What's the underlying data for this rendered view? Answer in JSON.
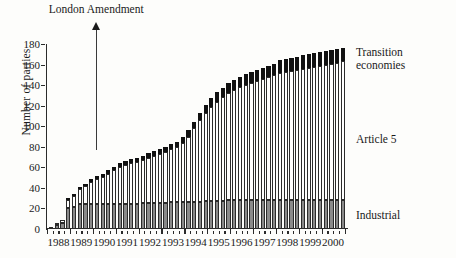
{
  "chart_data": {
    "type": "bar",
    "subtype": "stacked-bar",
    "title": "",
    "xlabel": "",
    "ylabel": "Number of parties",
    "ylim": [
      0,
      180
    ],
    "ytick_step": 20,
    "yticks": [
      0,
      20,
      40,
      60,
      80,
      100,
      120,
      140,
      160,
      180
    ],
    "grid": false,
    "legend_position": "right",
    "xlim": [
      "1988",
      "2001"
    ],
    "xtick_labels": [
      "1988",
      "1989",
      "1990",
      "1991",
      "1992",
      "1993",
      "1994",
      "1995",
      "1996",
      "1997",
      "1998",
      "1999",
      "2000"
    ],
    "x_note": "Quarterly observations from 1988 through 2000",
    "series": [
      {
        "name": "Industrial",
        "color": "#8a8a8a",
        "values": [
          2,
          4,
          6,
          20,
          21,
          24,
          24,
          24,
          24,
          24,
          24,
          24,
          24,
          24,
          24,
          24,
          25,
          25,
          25,
          25,
          25,
          26,
          26,
          26,
          26,
          26,
          26,
          27,
          27,
          27,
          27,
          28,
          28,
          28,
          28,
          28,
          28,
          28,
          28,
          28,
          28,
          28,
          28,
          28,
          28,
          28,
          28,
          28,
          28,
          28,
          28,
          28
        ]
      },
      {
        "name": "Article 5",
        "color": "#ffffff",
        "values": [
          0,
          2,
          3,
          8,
          11,
          15,
          18,
          22,
          25,
          27,
          30,
          33,
          36,
          38,
          40,
          41,
          42,
          44,
          46,
          48,
          50,
          52,
          54,
          58,
          64,
          72,
          80,
          86,
          92,
          97,
          101,
          104,
          107,
          110,
          112,
          114,
          116,
          118,
          120,
          122,
          124,
          125,
          126,
          127,
          128,
          129,
          130,
          131,
          132,
          133,
          134,
          135
        ]
      },
      {
        "name": "Transition economies",
        "color": "#111111",
        "values": [
          0,
          0,
          0,
          1,
          2,
          2,
          2,
          3,
          3,
          3,
          3,
          3,
          4,
          4,
          4,
          4,
          4,
          5,
          5,
          5,
          5,
          5,
          5,
          6,
          6,
          6,
          7,
          8,
          8,
          9,
          9,
          10,
          10,
          10,
          11,
          11,
          11,
          11,
          11,
          11,
          12,
          12,
          12,
          12,
          13,
          13,
          13,
          13,
          13,
          13,
          13,
          13
        ]
      }
    ],
    "totals_note": "Stacked totals rise from about 2 parties in 1988 to about 176 parties in 2000",
    "annotations": [
      {
        "label": "London Amendment",
        "x_year": "1990",
        "type": "up-arrow"
      }
    ]
  },
  "legend": {
    "transition_line1": "Transition",
    "transition_line2": "economies",
    "article5": "Article 5",
    "industrial": "Industrial"
  },
  "axis": {
    "ylabel": "Number of parties"
  },
  "annotation": {
    "london": "London Amendment"
  }
}
